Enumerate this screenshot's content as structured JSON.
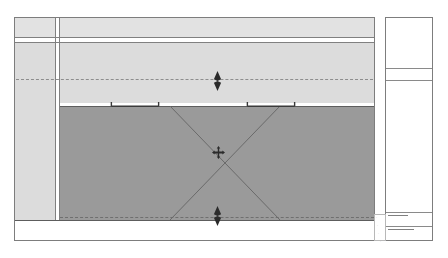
{
  "document": {
    "type": "cad-plan-view",
    "title": "",
    "background_color": "#ffffff"
  },
  "palette": {
    "paper": "#ffffff",
    "line": "#808080",
    "line_strong": "#5d5d5d",
    "fill_light": "#e2e2e2",
    "fill_light_alt": "#dcdcdc",
    "fill_selected": "#9a9a9a",
    "dash": "#8d8d8d",
    "grip": "#2b2b2b",
    "micro_text": "#9a9a9a"
  },
  "drawing": {
    "frame_label": "drawing-frame",
    "upper_band_label": "upper-wall-band",
    "lower_band_label": "lower-base-band",
    "selected_region_label": "selected-region",
    "column_label": "vertical-column-break",
    "top_dashed_label": "upper-hidden-line",
    "bottom_dashed_label": "lower-hidden-line"
  },
  "selection": {
    "state": "selected",
    "grips": [
      {
        "name": "top-arrow-grip",
        "shape": "double-arrow-vertical",
        "x": 216,
        "y": 77
      },
      {
        "name": "bottom-arrow-grip",
        "shape": "double-arrow-vertical",
        "x": 216,
        "y": 211
      },
      {
        "name": "center-move-grip",
        "shape": "move-cross",
        "x": 216,
        "y": 152
      },
      {
        "name": "left-bracket-grip",
        "shape": "stretch-bracket",
        "x": 137,
        "y": 88
      },
      {
        "name": "right-bracket-grip",
        "shape": "stretch-bracket",
        "x": 273,
        "y": 88
      }
    ],
    "diagonals": [
      {
        "name": "diagonal-nw-se"
      },
      {
        "name": "diagonal-ne-sw"
      }
    ]
  },
  "side_panel": {
    "name": "title-block-column",
    "rows": [
      {
        "name": "panel-row-1",
        "label": ""
      },
      {
        "name": "panel-row-2",
        "label": ""
      },
      {
        "name": "panel-row-3",
        "label": ""
      },
      {
        "name": "panel-row-4",
        "label": ""
      },
      {
        "name": "panel-row-5",
        "label": ""
      }
    ]
  },
  "annotations": {
    "micro_notes": [
      {
        "name": "micro-note-1",
        "text": "·"
      },
      {
        "name": "micro-note-2",
        "text": "·"
      },
      {
        "name": "micro-note-3",
        "text": "·"
      },
      {
        "name": "micro-note-4",
        "text": "·"
      }
    ]
  }
}
